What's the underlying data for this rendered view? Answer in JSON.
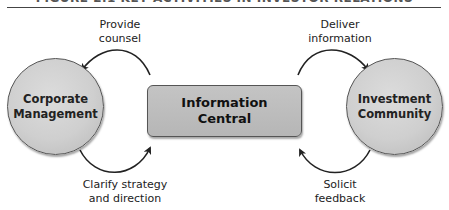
{
  "figure": {
    "title": "FIGURE 2.1   KEY ACTIVITIES IN INVESTOR RELATIONS"
  },
  "nodes": {
    "left": {
      "label": "Corporate\nManagement"
    },
    "center": {
      "label": "Information\nCentral"
    },
    "right": {
      "label": "Investment\nCommunity"
    }
  },
  "arrows": {
    "top_left": {
      "label": "Provide\ncounsel",
      "direction": "center-to-left"
    },
    "bottom_left": {
      "label": "Clarify strategy\nand direction",
      "direction": "left-to-center"
    },
    "top_right": {
      "label": "Deliver\ninformation",
      "direction": "center-to-right"
    },
    "bottom_right": {
      "label": "Solicit\nfeedback",
      "direction": "right-to-center"
    }
  },
  "colors": {
    "node_fill": "#cfcfcf",
    "node_border": "#555555",
    "arrow": "#222222"
  }
}
